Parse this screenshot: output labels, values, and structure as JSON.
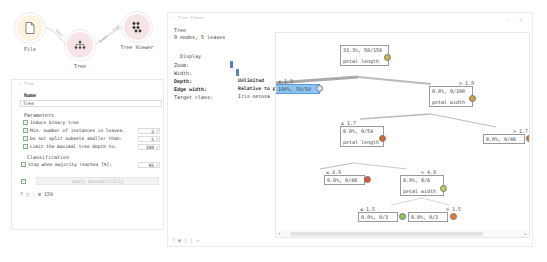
{
  "canvas": {
    "widgets": [
      {
        "id": "file",
        "label": "File"
      },
      {
        "id": "tree",
        "label": "Tree"
      },
      {
        "id": "tree_viewer",
        "label": "Tree Viewer"
      }
    ],
    "links": [
      {
        "label": "Data"
      },
      {
        "label": "Model → Tree"
      }
    ]
  },
  "tree_panel": {
    "title": "Tree",
    "name_label": "Name",
    "name_value": "Tree",
    "parameters_title": "Parameters",
    "params": [
      {
        "label": "Induce binary tree",
        "checked": true,
        "value": null
      },
      {
        "label": "Min. number of instances in leaves:",
        "checked": true,
        "value": "2"
      },
      {
        "label": "Do not split subsets smaller than:",
        "checked": true,
        "value": "5"
      },
      {
        "label": "Limit the maximal tree depth to:",
        "checked": true,
        "value": "100"
      }
    ],
    "classification_title": "Classification",
    "stop_majority": {
      "label": "Stop when majority reaches [%]:",
      "checked": true,
      "value": "95"
    },
    "apply_label": "Apply Automatically",
    "apply_checked": true,
    "status": {
      "help_icon": "?",
      "count": "150"
    }
  },
  "viewer": {
    "title": "Tree Viewer",
    "info_title": "Tree",
    "info_text": "9 nodes, 5 leaves",
    "display_title": "Display",
    "zoom_label": "Zoom:",
    "width_label": "Width:",
    "depth_label": "Depth:",
    "depth_value": "Unlimited",
    "edge_width_label": "Edge width:",
    "edge_width_value": "Relative to parent",
    "target_class_label": "Target class:",
    "target_class_value": "Iris-setosa",
    "nodes": [
      {
        "id": "root",
        "content": "33.3%, 50/150",
        "attr": "petal length",
        "pie": "#c8b845"
      },
      {
        "id": "n1",
        "edge": "≤ 1.9",
        "content": "100%, 50/50",
        "attr": null,
        "pie": "#8dc4f2",
        "selected": true
      },
      {
        "id": "n2",
        "edge": "> 1.9",
        "content": "0.0%, 0/100",
        "attr": "petal width",
        "pie": "#d8a030"
      },
      {
        "id": "n3",
        "edge": "≤ 1.7",
        "content": "0.0%, 0/54",
        "attr": "petal length",
        "pie": "#e0622e"
      },
      {
        "id": "n4",
        "edge": "> 1.7",
        "content": "0.0%, 0/46",
        "attr": null,
        "pie": "#e07028"
      },
      {
        "id": "n5",
        "edge": "≤ 4.9",
        "content": "0.0%, 0/48",
        "attr": null,
        "pie": "#e05a2a"
      },
      {
        "id": "n6",
        "edge": "> 4.9",
        "content": "0.0%, 0/6",
        "attr": "petal width",
        "pie": "#b6d050"
      },
      {
        "id": "n7",
        "edge": "≤ 1.5",
        "content": "0.0%, 0/3",
        "attr": null,
        "pie": "#8cc84a"
      },
      {
        "id": "n8",
        "edge": "> 1.5",
        "content": "0.0%, 0/3",
        "attr": null,
        "pie": "#e07a30"
      }
    ]
  }
}
